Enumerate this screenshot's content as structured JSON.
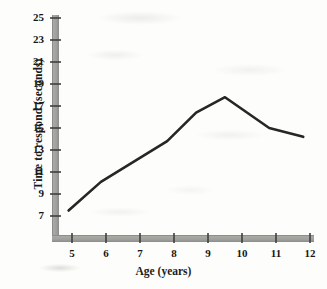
{
  "chart_data": {
    "type": "line",
    "title": "",
    "xlabel": "Age (years)",
    "ylabel": "Time to respond (seconds)",
    "xlim": [
      4.45,
      12.0
    ],
    "ylim": [
      5.9,
      25.0
    ],
    "xticks": [
      5,
      6,
      7,
      8,
      9,
      10,
      11,
      12
    ],
    "xticklabels": [
      "5",
      "6",
      "7",
      "8",
      "9",
      "10",
      "11",
      "12"
    ],
    "yticks": [
      7,
      9,
      11,
      13,
      15,
      17,
      19,
      21,
      23,
      25
    ],
    "yticklabels": [
      "7",
      "9",
      "11",
      "13",
      "15",
      "17",
      "19",
      "21",
      "23",
      "25"
    ],
    "grid": false,
    "legend": false,
    "series": [
      {
        "name": "Time to respond",
        "color": "#262626",
        "linewidth": 2.6,
        "x": [
          4.9,
          5.85,
          7.8,
          8.65,
          9.5,
          10.8,
          11.8
        ],
        "y": [
          7.5,
          10.1,
          13.8,
          16.4,
          17.8,
          15.0,
          14.2
        ]
      }
    ],
    "axis_style": {
      "axis_color": "#9b9b99",
      "axis_shadow_color": "#7d7d7b",
      "tick_color": "#4a4a4a",
      "axis_thickness_px": 7
    }
  }
}
